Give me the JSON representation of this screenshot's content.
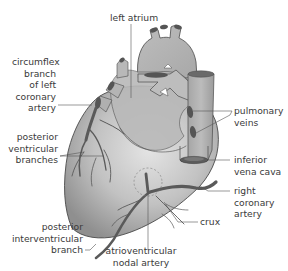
{
  "diagram": {
    "colors": {
      "heart_fill": "#b4b4b4",
      "heart_highlight": "#e2e2e2",
      "vessel_dark": "#5a5a5a",
      "outline": "#4a4a4a",
      "leader_line": "#555555",
      "label_text": "#3a3a3a"
    },
    "labels": {
      "left_atrium": {
        "lines": [
          "left atrium"
        ]
      },
      "circumflex": {
        "lines": [
          "circumflex",
          "branch",
          "of left",
          "coronary",
          "artery"
        ]
      },
      "pulmonary_veins": {
        "lines": [
          "pulmonary",
          "veins"
        ]
      },
      "posterior_ventricular": {
        "lines": [
          "posterior",
          "ventricular",
          "branches"
        ]
      },
      "inferior_vena_cava": {
        "lines": [
          "inferior",
          "vena cava"
        ]
      },
      "right_coronary": {
        "lines": [
          "right",
          "coronary",
          "artery"
        ]
      },
      "crux": {
        "lines": [
          "crux"
        ]
      },
      "posterior_interventricular": {
        "lines": [
          "posterior",
          "interventricular",
          "branch"
        ]
      },
      "av_nodal": {
        "lines": [
          "atrioventricular",
          "nodal artery"
        ]
      }
    }
  }
}
